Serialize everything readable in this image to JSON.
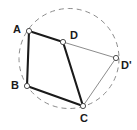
{
  "figure": {
    "type": "geometry-diagram",
    "width": 137,
    "height": 130,
    "background_color": "#ffffff"
  },
  "circle": {
    "name": "circumscribed-circle",
    "cx": 69,
    "cy": 58.5,
    "r": 50,
    "stroke_color": "#8c8c8c",
    "stroke_width": 1,
    "dash_pattern": "5,4",
    "fill": "none"
  },
  "points": [
    {
      "id": "A",
      "label": "A",
      "x": 29,
      "y": 31,
      "label_x": 13,
      "label_y": 24
    },
    {
      "id": "D",
      "label": "D",
      "x": 63,
      "y": 42,
      "label_x": 70,
      "label_y": 30
    },
    {
      "id": "B",
      "label": "B",
      "x": 27,
      "y": 86,
      "label_x": 11,
      "label_y": 80
    },
    {
      "id": "C",
      "label": "C",
      "x": 83,
      "y": 106,
      "label_x": 80,
      "label_y": 113
    },
    {
      "id": "Dp",
      "label": "D'",
      "x": 116,
      "y": 58,
      "label_x": 121,
      "label_y": 60
    }
  ],
  "vertex_marker": {
    "radius": 2.6,
    "fill": "#ffffff",
    "stroke_color": "#4d4d4d",
    "stroke_width": 1
  },
  "segments": [
    {
      "name": "segment-AD",
      "from": "A",
      "to": "D",
      "stroke_color": "#1a1a1a",
      "stroke_width": 2.1,
      "style": "solid"
    },
    {
      "name": "segment-AB",
      "from": "A",
      "to": "B",
      "stroke_color": "#1a1a1a",
      "stroke_width": 2.1,
      "style": "solid"
    },
    {
      "name": "segment-BC",
      "from": "B",
      "to": "C",
      "stroke_color": "#1a1a1a",
      "stroke_width": 2.1,
      "style": "solid"
    },
    {
      "name": "segment-DC",
      "from": "D",
      "to": "C",
      "stroke_color": "#1a1a1a",
      "stroke_width": 2.1,
      "style": "solid"
    },
    {
      "name": "segment-DDp",
      "from": "D",
      "to": "Dp",
      "stroke_color": "#8c8c8c",
      "stroke_width": 1,
      "style": "solid"
    },
    {
      "name": "segment-DpC",
      "from": "Dp",
      "to": "C",
      "stroke_color": "#8c8c8c",
      "stroke_width": 1,
      "style": "solid"
    }
  ],
  "colors": {
    "primary_stroke": "#1a1a1a",
    "secondary_stroke": "#8c8c8c",
    "label_text": "#1a1a1a",
    "marker_fill": "#ffffff"
  }
}
